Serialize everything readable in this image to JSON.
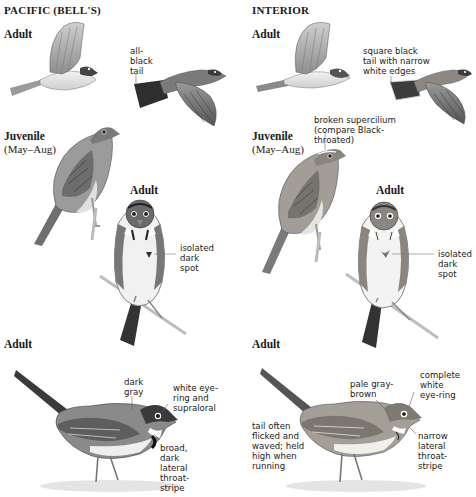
{
  "columns": [
    {
      "title": "PACIFIC (BELL'S)",
      "flight": {
        "label": "Adult",
        "note": "all-\nblack\ntail"
      },
      "juvenile": {
        "label": "Juvenile",
        "months": "(May–Aug)"
      },
      "front": {
        "label": "Adult",
        "note": "isolated\ndark\nspot"
      },
      "side": {
        "label": "Adult",
        "notes": {
          "crown": "dark\ngray",
          "eye": "white eye-\nring and\nsupraloral",
          "throat": "broad,\ndark\nlateral\nthroat-\nstripe"
        }
      }
    },
    {
      "title": "INTERIOR",
      "flight": {
        "label": "Adult",
        "note": "square black\ntail with narrow\nwhite edges"
      },
      "juvenile": {
        "label": "Juvenile",
        "months": "(May–Aug)",
        "note": "broken supercilium\n(compare Black-\nthroated)"
      },
      "front": {
        "label": "Adult",
        "note": "isolated\ndark\nspot"
      },
      "side": {
        "label": "Adult",
        "notes": {
          "crown": "pale gray-\nbrown",
          "eye": "complete\nwhite\neye-ring",
          "tail": "tail often\nflicked and\nwaved; held\nhigh when\nrunning",
          "throat": "narrow\nlateral\nthroat-\nstripe"
        }
      }
    }
  ],
  "colors": {
    "pacific_body": "#8a8a8a",
    "interior_body": "#a8a299",
    "dark": "#2a2a2a",
    "leader": "#555555"
  }
}
